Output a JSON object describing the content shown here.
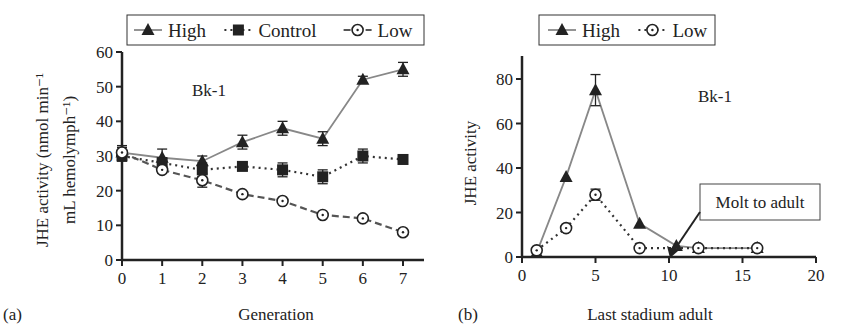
{
  "chart_data": [
    {
      "panel_label": "(a)",
      "type": "line",
      "title": "",
      "annotation": "Bk-1",
      "xlabel": "Generation",
      "ylabel_line1": "JHE activity (nmol min⁻¹",
      "ylabel_line2": "mL hemolymph⁻¹)",
      "xlim": [
        0,
        7
      ],
      "ylim": [
        0,
        60
      ],
      "xticks": [
        0,
        1,
        2,
        3,
        4,
        5,
        6,
        7
      ],
      "yticks": [
        0,
        10,
        20,
        30,
        40,
        50,
        60
      ],
      "grid": false,
      "legend_position": "top",
      "x": [
        0,
        1,
        2,
        3,
        4,
        5,
        6,
        7
      ],
      "series": [
        {
          "name": "High",
          "marker": "triangle",
          "line": "solid",
          "values": [
            31,
            29.5,
            28.5,
            34,
            38,
            35,
            52,
            55
          ],
          "errors": [
            2,
            2.5,
            1.5,
            2,
            2,
            2,
            1,
            2
          ]
        },
        {
          "name": "Control",
          "marker": "square",
          "line": "dotted",
          "values": [
            30,
            28,
            26,
            27,
            26,
            24,
            30,
            29
          ],
          "errors": [
            1.5,
            1.5,
            2,
            1,
            2,
            2,
            2,
            0.5
          ]
        },
        {
          "name": "Low",
          "marker": "open-circle",
          "line": "dashed",
          "values": [
            31,
            26,
            23,
            19,
            17,
            13,
            12,
            8
          ],
          "errors": [
            1.5,
            1,
            2,
            0.5,
            0.5,
            0.5,
            0.5,
            0.5
          ]
        }
      ]
    },
    {
      "panel_label": "(b)",
      "type": "line",
      "title": "",
      "annotation": "Bk-1",
      "callout": "Molt to adult",
      "callout_x": 10,
      "xlabel": "Last stadium adult",
      "ylabel_line1": "JHE activity",
      "ylabel_line2": "",
      "xlim": [
        0,
        20
      ],
      "ylim": [
        0,
        90
      ],
      "xticks": [
        0,
        5,
        10,
        15,
        20
      ],
      "yticks": [
        0,
        20,
        40,
        60,
        80
      ],
      "grid": false,
      "legend_position": "top",
      "series": [
        {
          "name": "High",
          "marker": "triangle",
          "line": "solid",
          "x": [
            1,
            3,
            5,
            8,
            10.5,
            12,
            16
          ],
          "values": [
            2,
            36,
            75,
            15,
            5,
            4,
            4
          ],
          "errors": [
            0,
            0,
            7,
            0,
            0,
            0,
            0
          ]
        },
        {
          "name": "Low",
          "marker": "open-circle",
          "line": "dotted",
          "x": [
            1,
            3,
            5,
            8,
            12,
            16
          ],
          "values": [
            3,
            13,
            28,
            4,
            4,
            4
          ],
          "errors": [
            0,
            0,
            2.5,
            0,
            0,
            0
          ]
        }
      ]
    }
  ]
}
